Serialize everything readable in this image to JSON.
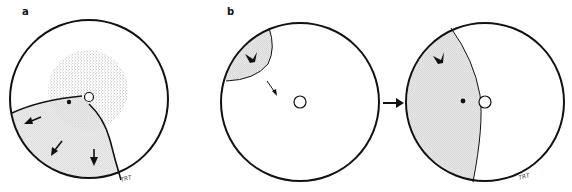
{
  "figure": {
    "panels": [
      {
        "id": "a",
        "label": "a",
        "signature": "TRT",
        "description": "Sky circle with stippled central disk, open circle (Sun), black dot, curved boundary and shaded lower-left region with three outward arrows"
      },
      {
        "id": "b",
        "label": "b",
        "signature": "TRT",
        "description": "Two sky circles connected by a right-pointing arrow; left circle has shaded cap top-left with chevron and small arrow toward center; right circle has shaded left lens with chevron, dot and open circle"
      }
    ],
    "colors": {
      "stroke": "#111111",
      "shade": "#d9d9d9",
      "stipple": "#9a9a9a",
      "background": "#ffffff"
    }
  }
}
